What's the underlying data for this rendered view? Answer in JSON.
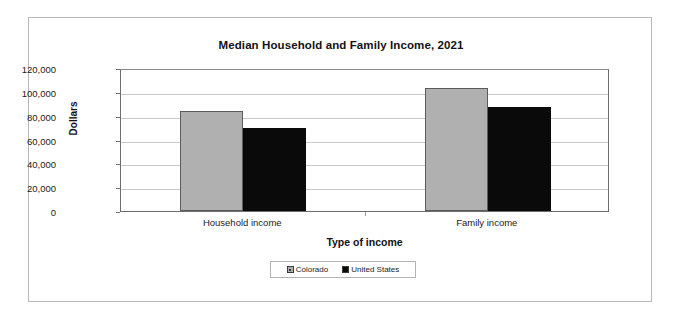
{
  "chart_data": {
    "type": "bar",
    "title": "Median Household and Family Income, 2021",
    "xlabel": "Type of income",
    "ylabel": "Dollars",
    "categories": [
      "Household income",
      "Family income"
    ],
    "series": [
      {
        "name": "Colorado",
        "color": "#b0b0b0",
        "values": [
          84000,
          103000
        ]
      },
      {
        "name": "United States",
        "color": "#0a0a0a",
        "values": [
          70000,
          87000
        ]
      }
    ],
    "ylim": [
      0,
      120000
    ],
    "ytick_labels": [
      "120,000",
      "100,000",
      "80,000",
      "60,000",
      "40,000",
      "20,000",
      "0"
    ],
    "ytick_values": [
      120000,
      100000,
      80000,
      60000,
      40000,
      20000,
      0
    ],
    "grid": true,
    "legend_position": "bottom"
  }
}
